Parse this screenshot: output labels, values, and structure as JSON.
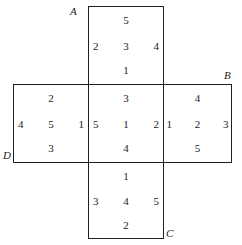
{
  "diagram": {
    "kind": "cube-net-cross",
    "stroke_color": "#1f1f1f",
    "background_color": "#ffffff",
    "vertex_labels": {
      "a": "A",
      "b": "B",
      "c": "C",
      "d": "D"
    },
    "faces": [
      {
        "id": "top",
        "position": "top",
        "pips": {
          "top": "5",
          "left": "2",
          "center": "3",
          "right": "4",
          "bottom": "1"
        }
      },
      {
        "id": "left",
        "position": "left",
        "pips": {
          "top": "2",
          "left": "4",
          "center": "5",
          "right": "1",
          "bottom": "3"
        }
      },
      {
        "id": "center",
        "position": "center",
        "pips": {
          "top": "3",
          "left": "5",
          "center": "1",
          "right": "2",
          "bottom": "4"
        }
      },
      {
        "id": "right",
        "position": "right",
        "pips": {
          "top": "4",
          "left": "1",
          "center": "2",
          "right": "3",
          "bottom": "5"
        }
      },
      {
        "id": "bottom",
        "position": "bottom",
        "pips": {
          "top": "1",
          "left": "3",
          "center": "4",
          "right": "5",
          "bottom": "2"
        }
      }
    ]
  }
}
